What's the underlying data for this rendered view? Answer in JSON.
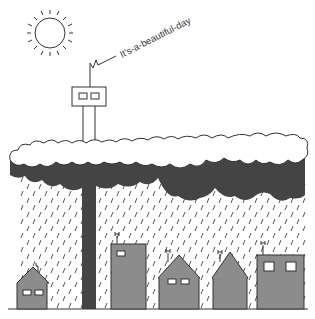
{
  "caption": "It's-a-beautiful-day",
  "colors": {
    "background": "#ffffff",
    "outline": "#333333",
    "cloud_dark": "#444444",
    "building_fill": "#8c8c8c",
    "window_fill": "#ffffff",
    "rain": "#555555"
  },
  "elements": {
    "sun": {
      "icon": "sun-icon"
    },
    "device": {
      "icon": "transmitter-box-icon",
      "antenna": "antenna-zigzag-icon"
    },
    "cloud": {
      "icon": "cloud-layer"
    },
    "rain": {
      "icon": "rain-streaks"
    },
    "buildings": [
      {
        "type": "house",
        "windows": 2
      },
      {
        "type": "tower",
        "windows": 1
      },
      {
        "type": "house",
        "windows": 2
      },
      {
        "type": "house",
        "windows": 0
      },
      {
        "type": "building",
        "windows": 2
      }
    ]
  }
}
